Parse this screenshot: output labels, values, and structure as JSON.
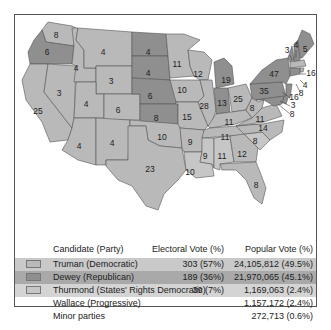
{
  "map": {
    "title": "1948 U.S. Presidential Election",
    "legend_colors": {
      "truman": "#b9b9b9",
      "dewey": "#8f8f8f",
      "thurmond": "#c6c6c6"
    },
    "states": [
      {
        "name": "Washington",
        "ev": "8",
        "party": "truman"
      },
      {
        "name": "Oregon",
        "ev": "6",
        "party": "dewey"
      },
      {
        "name": "California",
        "ev": "25",
        "party": "truman"
      },
      {
        "name": "Idaho",
        "ev": "4",
        "party": "truman"
      },
      {
        "name": "Nevada",
        "ev": "3",
        "party": "truman"
      },
      {
        "name": "Montana",
        "ev": "4",
        "party": "truman"
      },
      {
        "name": "Wyoming",
        "ev": "3",
        "party": "truman"
      },
      {
        "name": "Utah",
        "ev": "4",
        "party": "truman"
      },
      {
        "name": "Colorado",
        "ev": "6",
        "party": "truman"
      },
      {
        "name": "Arizona",
        "ev": "4",
        "party": "truman"
      },
      {
        "name": "New Mexico",
        "ev": "4",
        "party": "truman"
      },
      {
        "name": "North Dakota",
        "ev": "4",
        "party": "dewey"
      },
      {
        "name": "South Dakota",
        "ev": "4",
        "party": "dewey"
      },
      {
        "name": "Nebraska",
        "ev": "6",
        "party": "dewey"
      },
      {
        "name": "Kansas",
        "ev": "8",
        "party": "dewey"
      },
      {
        "name": "Oklahoma",
        "ev": "10",
        "party": "truman"
      },
      {
        "name": "Texas",
        "ev": "23",
        "party": "truman"
      },
      {
        "name": "Minnesota",
        "ev": "11",
        "party": "truman"
      },
      {
        "name": "Iowa",
        "ev": "10",
        "party": "truman"
      },
      {
        "name": "Missouri",
        "ev": "15",
        "party": "truman"
      },
      {
        "name": "Arkansas",
        "ev": "9",
        "party": "truman"
      },
      {
        "name": "Louisiana",
        "ev": "10",
        "party": "thurmond"
      },
      {
        "name": "Wisconsin",
        "ev": "12",
        "party": "truman"
      },
      {
        "name": "Illinois",
        "ev": "28",
        "party": "truman"
      },
      {
        "name": "Michigan",
        "ev": "19",
        "party": "dewey"
      },
      {
        "name": "Indiana",
        "ev": "13",
        "party": "dewey"
      },
      {
        "name": "Ohio",
        "ev": "25",
        "party": "truman"
      },
      {
        "name": "Kentucky",
        "ev": "11",
        "party": "truman"
      },
      {
        "name": "Tennessee",
        "ev": "11",
        "party": "truman"
      },
      {
        "name": "Mississippi",
        "ev": "9",
        "party": "thurmond"
      },
      {
        "name": "Alabama",
        "ev": "11",
        "party": "thurmond"
      },
      {
        "name": "Georgia",
        "ev": "12",
        "party": "truman"
      },
      {
        "name": "Florida",
        "ev": "8",
        "party": "truman"
      },
      {
        "name": "South Carolina",
        "ev": "8",
        "party": "thurmond"
      },
      {
        "name": "North Carolina",
        "ev": "14",
        "party": "truman"
      },
      {
        "name": "Virginia",
        "ev": "11",
        "party": "truman"
      },
      {
        "name": "West Virginia",
        "ev": "8",
        "party": "truman"
      },
      {
        "name": "Pennsylvania",
        "ev": "35",
        "party": "dewey"
      },
      {
        "name": "New York",
        "ev": "47",
        "party": "dewey"
      },
      {
        "name": "Vermont",
        "ev": "3",
        "party": "dewey"
      },
      {
        "name": "New Hampshire",
        "ev": "4",
        "party": "dewey"
      },
      {
        "name": "Maine",
        "ev": "5",
        "party": "dewey"
      },
      {
        "name": "Massachusetts",
        "ev": "16",
        "party": "truman"
      },
      {
        "name": "Rhode Island",
        "ev": "4",
        "party": "truman"
      },
      {
        "name": "Connecticut",
        "ev": "8",
        "party": "dewey"
      },
      {
        "name": "New Jersey",
        "ev": "16",
        "party": "dewey"
      },
      {
        "name": "Delaware",
        "ev": "3",
        "party": "dewey"
      },
      {
        "name": "Maryland",
        "ev": "8",
        "party": "dewey"
      }
    ]
  },
  "legend": {
    "headers": {
      "candidate": "Candidate (Party)",
      "electoral": "Electoral Vote (%)",
      "popular": "Popular Vote (%)"
    },
    "rows": [
      {
        "candidate": "Truman (Democratic)",
        "electoral": "303 (57%)",
        "popular": "24,105,812 (49.5%)",
        "swatch": "#b9b9b9",
        "row_bg": "#c9c9c9"
      },
      {
        "candidate": "Dewey (Republican)",
        "electoral": "189 (36%)",
        "popular": "21,970,065 (45.1%)",
        "swatch": "#8f8f8f",
        "row_bg": "#a9a9a9"
      },
      {
        "candidate": "Thurmond (States' Rights Democratic)",
        "electoral": "39 (7%)",
        "popular": "1,169,063 (2.4%)",
        "swatch": "#c6c6c6",
        "row_bg": "#d4d4d4"
      },
      {
        "candidate": "Wallace (Progressive)",
        "electoral": "",
        "popular": "1,157,172 (2.4%)"
      },
      {
        "candidate": "Minor parties",
        "electoral": "",
        "popular": "272,713 (0.6%)"
      }
    ]
  }
}
